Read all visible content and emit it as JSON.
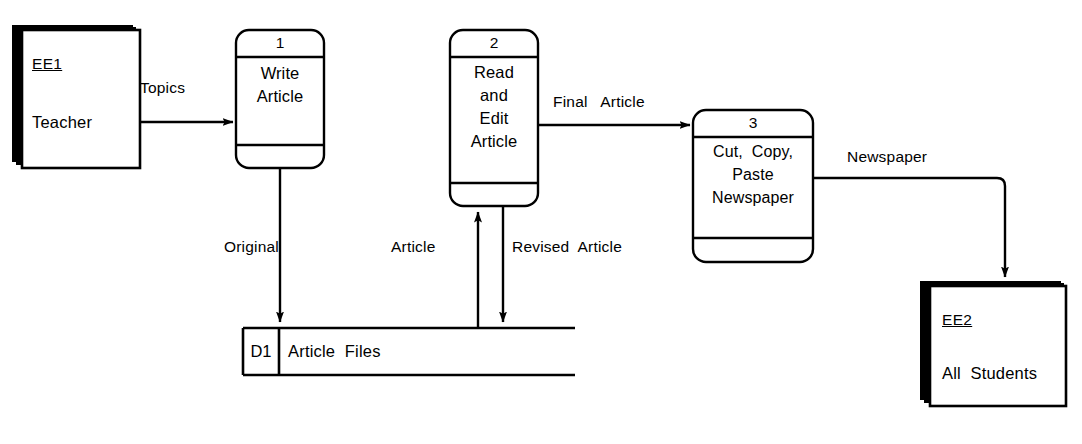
{
  "diagram": {
    "type": "data-flow-diagram",
    "notation": "Gane-Sarson",
    "background_color": "#ffffff",
    "line_color": "#000000"
  },
  "external_entities": [
    {
      "id": "EE1",
      "name": "Teacher",
      "position": {
        "x": 22,
        "y": 30,
        "width": 118,
        "height": 138
      }
    },
    {
      "id": "EE2",
      "name": "All  Students",
      "position": {
        "x": 930,
        "y": 286,
        "width": 136,
        "height": 120
      }
    }
  ],
  "processes": [
    {
      "number": "1",
      "name_lines": [
        "Write",
        "Article"
      ],
      "position": {
        "x": 236,
        "y": 30,
        "width": 88,
        "height": 138
      }
    },
    {
      "number": "2",
      "name_lines": [
        "Read",
        "and",
        "Edit",
        "Article"
      ],
      "position": {
        "x": 450,
        "y": 30,
        "width": 88,
        "height": 176
      }
    },
    {
      "number": "3",
      "name_lines": [
        "Cut,  Copy,",
        "Paste",
        "Newspaper"
      ],
      "position": {
        "x": 693,
        "y": 110,
        "width": 120,
        "height": 152
      }
    }
  ],
  "data_stores": [
    {
      "id": "D1",
      "name": "Article  Files",
      "position": {
        "x": 243,
        "y": 328,
        "width": 332,
        "height": 47
      }
    }
  ],
  "data_flows": [
    {
      "label": "Topics",
      "from": "EE1",
      "to": "1",
      "label_x": 140,
      "label_y": 79
    },
    {
      "label": "Original",
      "from": "1",
      "to": "D1",
      "label_x": 224,
      "label_y": 238
    },
    {
      "label": "Article",
      "from": "D1",
      "to": "2",
      "label_x": 391,
      "label_y": 238
    },
    {
      "label": "Revised  Article",
      "from": "2",
      "to": "D1",
      "label_x": 512,
      "label_y": 238
    },
    {
      "label": "Final   Article",
      "from": "2",
      "to": "3",
      "label_x": 553,
      "label_y": 93
    },
    {
      "label": "Newspaper",
      "from": "3",
      "to": "EE2",
      "label_x": 847,
      "label_y": 148
    }
  ]
}
